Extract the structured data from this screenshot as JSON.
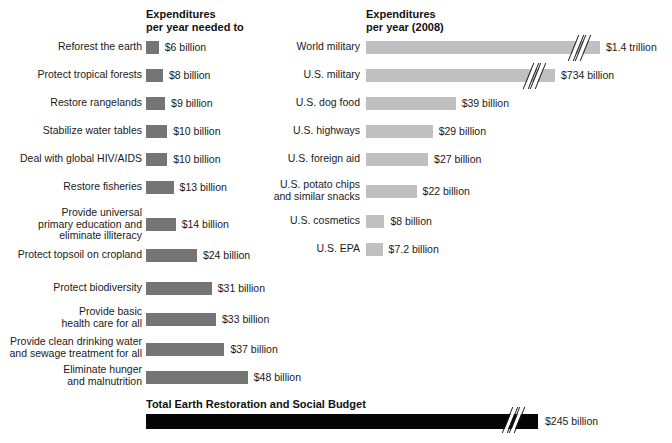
{
  "chart_data": {
    "type": "bar",
    "title": "",
    "xlabel": "",
    "ylabel": "",
    "grid": false,
    "legend": "none",
    "orientation": "horizontal",
    "panels": [
      {
        "id": "needed",
        "header": "Expenditures\nper year needed to",
        "unit": "billion USD",
        "bar_color": "#757575",
        "axis_origin_px": 146,
        "px_per_billion": 2.12,
        "categories": [
          "Reforest the earth",
          "Protect tropical forests",
          "Restore rangelands",
          "Stabilize water tables",
          "Deal with global HIV/AIDS",
          "Restore fisheries",
          "Provide universal\nprimary education and\neliminate illiteracy",
          "Protect topsoil on cropland",
          "Protect biodiversity",
          "Provide basic\nhealth care for all",
          "Provide clean drinking water\nand sewage treatment for all",
          "Eliminate hunger\nand malnutrition"
        ],
        "values": [
          6,
          8,
          9,
          10,
          10,
          13,
          14,
          24,
          31,
          33,
          37,
          48
        ],
        "value_labels": [
          "$6 billion",
          "$8 billion",
          "$9 billion",
          "$10 billion",
          "$10 billion",
          "$13 billion",
          "$14 billion",
          "$24 billion",
          "$31 billion",
          "$33 billion",
          "$37 billion",
          "$48 billion"
        ]
      },
      {
        "id": "actual",
        "header": "Expenditures\nper year (2008)",
        "unit": "billion USD",
        "bar_color": "#c0c0c0",
        "axis_origin_px": 366,
        "px_per_billion": 2.3,
        "categories": [
          "World military",
          "U.S. military",
          "U.S. dog food",
          "U.S. highways",
          "U.S. foreign aid",
          "U.S. potato chips\nand similar snacks",
          "U.S. cosmetics",
          "U.S. EPA"
        ],
        "values": [
          1400,
          734,
          39,
          29,
          27,
          22,
          8,
          7.2
        ],
        "value_labels": [
          "$1.4 trillion",
          "$734 billion",
          "$39 billion",
          "$29 billion",
          "$27 billion",
          "$22 billion",
          "$8 billion",
          "$7.2 billion"
        ],
        "truncated_bars": [
          "World military",
          "U.S. military"
        ]
      }
    ],
    "total": {
      "title": "Total Earth Restoration and Social Budget",
      "value": 245,
      "value_label": "$245 billion",
      "bar_color": "#050505",
      "truncated": true
    }
  },
  "colors": {
    "needed_bar": "#757575",
    "actual_bar": "#c0c0c0",
    "total_bar": "#050505",
    "text": "#1a1a1a",
    "background": "#ffffff"
  }
}
